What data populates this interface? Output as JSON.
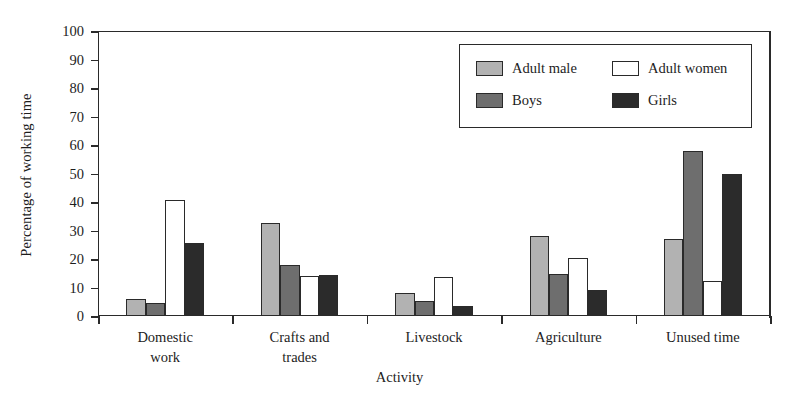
{
  "chart_data": {
    "type": "bar",
    "title": "",
    "xlabel": "Activity",
    "ylabel": "Percentage of working time",
    "ylim": [
      0,
      100
    ],
    "ytick_step": 10,
    "yticks": [
      100,
      90,
      80,
      70,
      60,
      50,
      40,
      30,
      20,
      10,
      0
    ],
    "grid": false,
    "legend_position": "upper right inside",
    "categories": [
      "Domestic work",
      "Crafts and trades",
      "Livestock",
      "Agriculture",
      "Unused time"
    ],
    "category_lines": [
      [
        "Domestic",
        "work"
      ],
      [
        "Crafts and",
        "trades"
      ],
      [
        "Livestock"
      ],
      [
        "Agriculture"
      ],
      [
        "Unused time"
      ]
    ],
    "series": [
      {
        "name": "Adult male",
        "color": "#b2b2b2",
        "values": [
          6.0,
          32.8,
          8.1,
          28.0,
          27.0
        ]
      },
      {
        "name": "Boys",
        "color": "#6e6e6e",
        "values": [
          4.5,
          18.0,
          5.3,
          14.7,
          57.8
        ]
      },
      {
        "name": "Adult women",
        "color": "#ffffff",
        "values": [
          40.6,
          14.0,
          13.7,
          20.5,
          12.2
        ]
      },
      {
        "name": "Girls",
        "color": "#2b2b2b",
        "values": [
          25.6,
          14.3,
          3.4,
          9.3,
          49.7
        ]
      }
    ],
    "series_draw_order": [
      "Adult male",
      "Boys",
      "Adult women",
      "Girls"
    ]
  },
  "legend": {
    "entries": [
      {
        "label": "Adult male",
        "color": "#b2b2b2"
      },
      {
        "label": "Adult women",
        "color": "#ffffff"
      },
      {
        "label": "Boys",
        "color": "#6e6e6e"
      },
      {
        "label": "Girls",
        "color": "#2b2b2b"
      }
    ]
  },
  "axes": {
    "y_title": "Percentage of working time",
    "x_title": "Activity",
    "y_tick_labels": [
      "100",
      "90",
      "80",
      "70",
      "60",
      "50",
      "40",
      "30",
      "20",
      "10",
      "0"
    ]
  },
  "colors": {
    "axis": "#2a2a2a",
    "text": "#1d1d1d",
    "background": "#ffffff",
    "adult_male": "#b2b2b2",
    "boys": "#6e6e6e",
    "adult_women": "#ffffff",
    "girls": "#2b2b2b"
  }
}
